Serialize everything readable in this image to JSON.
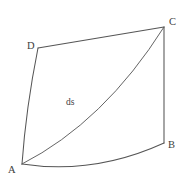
{
  "figure": {
    "background_color": "#ffffff",
    "line_color": "#555555",
    "label_color": "#3d3d3d",
    "width": 188,
    "height": 186,
    "vertices": [
      {
        "id": "A",
        "label": "A",
        "x": 22,
        "y": 164,
        "label_x": 8,
        "label_y": 165
      },
      {
        "id": "B",
        "label": "B",
        "x": 164,
        "y": 143,
        "label_x": 168,
        "label_y": 140
      },
      {
        "id": "C",
        "label": "C",
        "x": 164,
        "y": 27,
        "label_x": 169,
        "label_y": 17
      },
      {
        "id": "D",
        "label": "D",
        "x": 38,
        "y": 48,
        "label_x": 27,
        "label_y": 41
      }
    ],
    "edges": [
      {
        "id": "AB",
        "from": "A",
        "to": "B",
        "shape": "curved",
        "bow": "downward",
        "path": "M 22 164 Q 94 175 164 143"
      },
      {
        "id": "BC",
        "from": "B",
        "to": "C",
        "shape": "straight",
        "bow": "none",
        "path": "M 164 143 L 164 27"
      },
      {
        "id": "CD",
        "from": "C",
        "to": "D",
        "shape": "straight",
        "bow": "none",
        "path": "M 164 27 L 38 48"
      },
      {
        "id": "DA",
        "from": "D",
        "to": "A",
        "shape": "curved",
        "bow": "leftward",
        "path": "M 38 48 Q 26 108 22 164"
      }
    ],
    "diagonal": {
      "id": "AC",
      "from": "A",
      "to": "C",
      "shape": "curved",
      "bow": "toward-bottom-right",
      "label": "ds",
      "label_x": 66,
      "label_y": 98,
      "path": "M 22 164 Q 104 122 164 27"
    }
  }
}
